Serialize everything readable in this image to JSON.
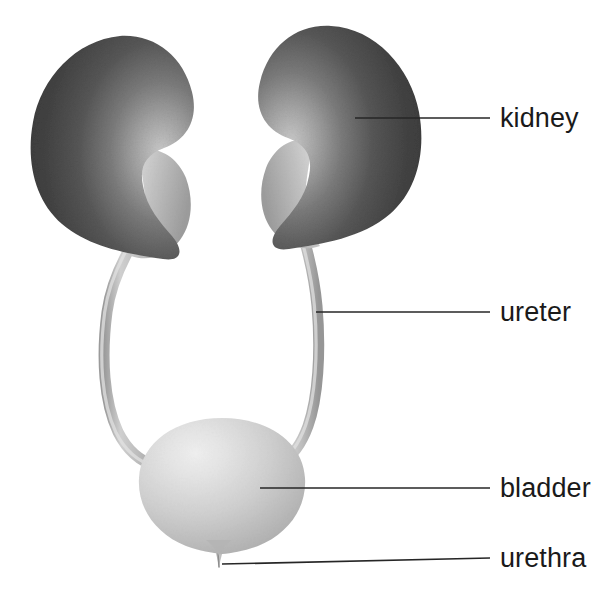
{
  "figure": {
    "background_color": "#ffffff",
    "width": 610,
    "height": 600
  },
  "style": {
    "leader_line_color": "#262626",
    "label_text_color": "#1a1a1a",
    "kidney_dark": "#3d3d3d",
    "kidney_mid": "#5a5a5a",
    "kidney_light": "#c8c8c8",
    "ureter_color": "#b0b0b0",
    "bladder_light": "#e3e3e3",
    "bladder_mid": "#c2c2c2",
    "bladder_dark": "#9e9e9e"
  },
  "labels": [
    {
      "id": "kidney",
      "text": "kidney",
      "leader_from_x": 355,
      "leader_to_x": 490,
      "leader_y": 118
    },
    {
      "id": "ureter",
      "text": "ureter",
      "leader_from_x": 316,
      "leader_to_x": 490,
      "leader_y": 312
    },
    {
      "id": "bladder",
      "text": "bladder",
      "leader_from_x": 260,
      "leader_to_x": 490,
      "leader_y": 488
    },
    {
      "id": "urethra",
      "text": "urethra",
      "leader_from_x": 222,
      "leader_to_x": 490,
      "leader_y": 560
    }
  ],
  "organs": [
    {
      "id": "kidney-left",
      "name": "kidney",
      "side": "left",
      "shade": "dark",
      "bbox": [
        30,
        35,
        165,
        225
      ]
    },
    {
      "id": "kidney-right",
      "name": "kidney",
      "side": "right",
      "shade": "dark",
      "bbox": [
        275,
        25,
        145,
        215
      ]
    },
    {
      "id": "ureter-left",
      "name": "ureter",
      "side": "left",
      "shade": "light"
    },
    {
      "id": "ureter-right",
      "name": "ureter",
      "side": "right",
      "shade": "light"
    },
    {
      "id": "bladder",
      "name": "bladder",
      "side": "center",
      "shade": "light",
      "bbox": [
        140,
        418,
        165,
        140
      ]
    },
    {
      "id": "urethra",
      "name": "urethra",
      "side": "center",
      "shade": "light",
      "bbox": [
        212,
        545,
        16,
        22
      ]
    }
  ]
}
